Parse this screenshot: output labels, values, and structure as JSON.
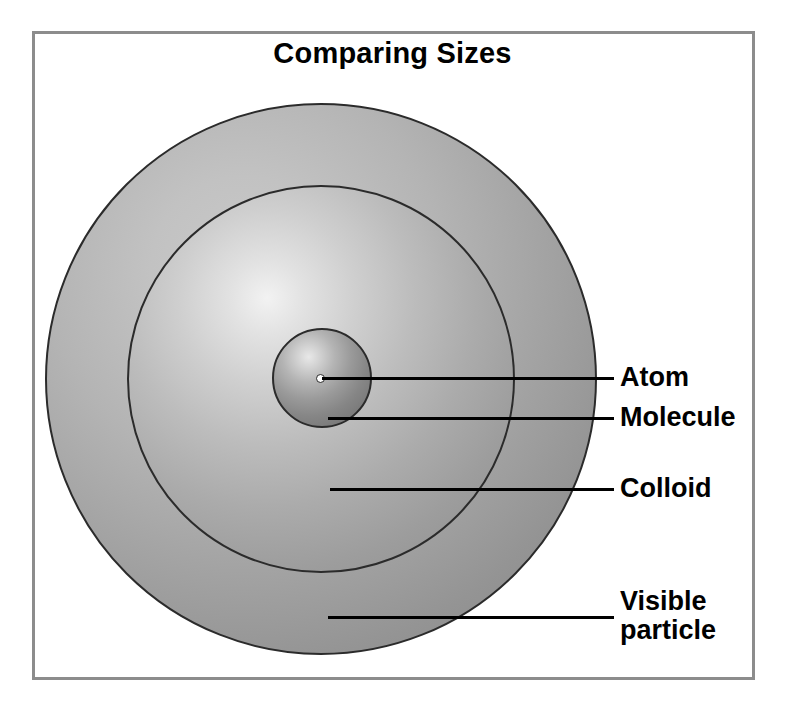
{
  "figure": {
    "title": "Comparing Sizes",
    "frame_color": "#8c8c8c",
    "background_color": "#ffffff",
    "line_color": "#000000",
    "text_color": "#000000"
  },
  "chart_data": {
    "type": "diagram",
    "title": "Comparing Sizes",
    "subtitle": "",
    "xlabel": "",
    "ylabel": "",
    "legend_position": "right",
    "grid": false,
    "categories": [
      "Atom",
      "Molecule",
      "Colloid",
      "Visible particle"
    ],
    "values": [
      4.5,
      50,
      194,
      276
    ],
    "value_unit": "drawn radius in pixels",
    "items": [
      {
        "label": "Atom",
        "shape": "dot",
        "center_x": 320,
        "center_y": 378,
        "radius": 4.5,
        "fill": "#ffffff",
        "stroke": "#2b2b2b",
        "leader_line": {
          "x1": 322,
          "y1": 378,
          "x2": 614,
          "y2": 378
        },
        "label_x": 620,
        "label_y": 378
      },
      {
        "label": "Molecule",
        "shape": "sphere",
        "center_x": 322,
        "center_y": 378,
        "radius": 50,
        "fill": "#9a9a9a",
        "stroke": "#2b2b2b",
        "leader_line": {
          "x1": 328,
          "y1": 418,
          "x2": 614,
          "y2": 418
        },
        "label_x": 620,
        "label_y": 418
      },
      {
        "label": "Colloid",
        "shape": "sphere",
        "center_x": 321,
        "center_y": 379,
        "radius": 194,
        "fill": "#b4b4b4",
        "stroke": "#2b2b2b",
        "leader_line": {
          "x1": 330,
          "y1": 489,
          "x2": 614,
          "y2": 489
        },
        "label_x": 620,
        "label_y": 489
      },
      {
        "label": "Visible particle",
        "label_line_1": "Visible",
        "label_line_2": "particle",
        "shape": "sphere",
        "center_x": 321,
        "center_y": 379,
        "radius": 276,
        "fill": "#a8a8a8",
        "stroke": "#2b2b2b",
        "leader_line": {
          "x1": 328,
          "y1": 617,
          "x2": 614,
          "y2": 617
        },
        "label_x": 620,
        "label_y": 617
      }
    ]
  },
  "labels": {
    "atom": "Atom",
    "molecule": "Molecule",
    "colloid": "Colloid",
    "visible_particle": "Visible\nparticle"
  }
}
